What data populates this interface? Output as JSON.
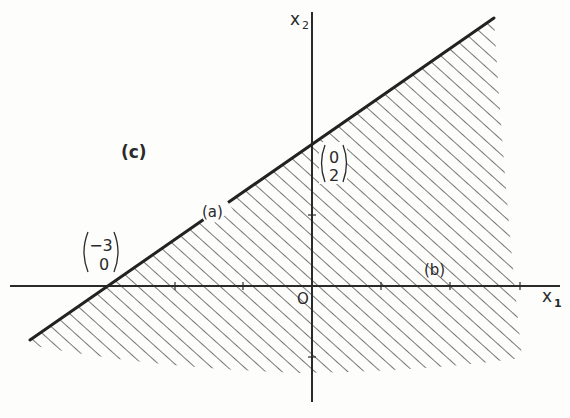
{
  "figure": {
    "panel_label": "(c)",
    "axes": {
      "x_label": "x",
      "x_sub": "1",
      "y_label": "x",
      "y_sub": "2",
      "origin_label": "O"
    },
    "constraint_labels": {
      "a": "(a)",
      "b": "(b)"
    },
    "points": [
      {
        "name": "x-intercept",
        "top": "−3",
        "bottom": "0"
      },
      {
        "name": "y-intercept",
        "top": "0",
        "bottom": "2"
      }
    ],
    "colors": {
      "ink": "#2a2a2a",
      "hatch": "#555555",
      "background": "#fdfdfc"
    }
  }
}
